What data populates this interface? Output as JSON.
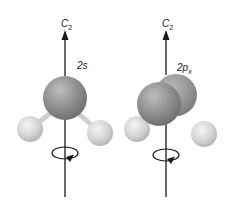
{
  "figures": [
    {
      "axis_label": "C",
      "axis_subscript": "2",
      "orbital_label": "2s",
      "orbital_main": "2s",
      "orbital_sub": ""
    },
    {
      "axis_label": "C",
      "axis_subscript": "2",
      "orbital_label": "2px",
      "orbital_main": "2p",
      "orbital_sub": "x"
    }
  ],
  "colors": {
    "central_sphere": "#8a8a8a",
    "hydrogen_sphere": "#d6d6d6",
    "axis": "#1a1a1a",
    "background": "#ffffff"
  }
}
